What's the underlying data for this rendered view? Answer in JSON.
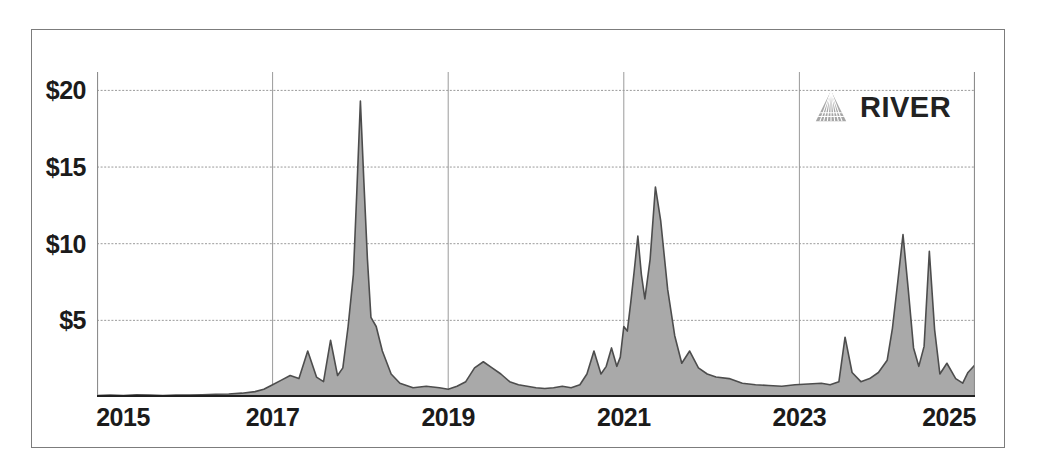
{
  "brand": {
    "name": "RIVER",
    "mark_icon": "river-delta-triangle-icon"
  },
  "chart_data": {
    "type": "area",
    "title": "",
    "subtitle": "",
    "xlabel": "",
    "ylabel": "",
    "grid": true,
    "legend_position": "none",
    "xlim": [
      2015,
      2025
    ],
    "ylim": [
      0,
      21.2
    ],
    "y_ticks": [
      5,
      10,
      15,
      20
    ],
    "y_tick_labels": [
      "$5",
      "$10",
      "$15",
      "$20"
    ],
    "x_ticks": [
      2015,
      2017,
      2019,
      2021,
      2023,
      2025
    ],
    "x_tick_labels": [
      "2015",
      "2017",
      "2019",
      "2021",
      "2023",
      "2025"
    ],
    "series": [
      {
        "name": "value",
        "fill_color": "#a9a9a9",
        "line_color": "#4d4d4d",
        "x": [
          2015.0,
          2015.15,
          2015.3,
          2015.45,
          2015.6,
          2015.75,
          2015.9,
          2016.05,
          2016.2,
          2016.35,
          2016.5,
          2016.65,
          2016.8,
          2016.9,
          2017.0,
          2017.1,
          2017.2,
          2017.3,
          2017.4,
          2017.5,
          2017.58,
          2017.66,
          2017.74,
          2017.8,
          2017.86,
          2017.92,
          2017.96,
          2018.0,
          2018.04,
          2018.08,
          2018.12,
          2018.18,
          2018.25,
          2018.35,
          2018.45,
          2018.6,
          2018.75,
          2018.9,
          2019.0,
          2019.1,
          2019.2,
          2019.3,
          2019.4,
          2019.5,
          2019.6,
          2019.7,
          2019.8,
          2019.9,
          2020.0,
          2020.1,
          2020.2,
          2020.3,
          2020.4,
          2020.5,
          2020.58,
          2020.66,
          2020.74,
          2020.8,
          2020.86,
          2020.92,
          2020.96,
          2021.0,
          2021.04,
          2021.08,
          2021.12,
          2021.16,
          2021.2,
          2021.24,
          2021.3,
          2021.36,
          2021.42,
          2021.5,
          2021.58,
          2021.66,
          2021.75,
          2021.85,
          2021.95,
          2022.05,
          2022.2,
          2022.35,
          2022.5,
          2022.65,
          2022.8,
          2022.95,
          2023.1,
          2023.25,
          2023.35,
          2023.45,
          2023.52,
          2023.6,
          2023.7,
          2023.8,
          2023.9,
          2024.0,
          2024.06,
          2024.12,
          2024.18,
          2024.24,
          2024.3,
          2024.36,
          2024.42,
          2024.48,
          2024.54,
          2024.6,
          2024.68,
          2024.78,
          2024.86,
          2024.92,
          2025.0
        ],
        "y": [
          0.1,
          0.12,
          0.1,
          0.15,
          0.12,
          0.1,
          0.13,
          0.12,
          0.15,
          0.18,
          0.2,
          0.25,
          0.35,
          0.5,
          0.8,
          1.1,
          1.4,
          1.2,
          3.0,
          1.3,
          1.0,
          3.7,
          1.4,
          1.9,
          4.6,
          8.0,
          13.5,
          19.3,
          14.0,
          9.0,
          5.2,
          4.6,
          3.0,
          1.5,
          0.9,
          0.6,
          0.7,
          0.6,
          0.5,
          0.7,
          1.0,
          1.9,
          2.3,
          1.9,
          1.5,
          1.0,
          0.8,
          0.7,
          0.6,
          0.55,
          0.6,
          0.7,
          0.6,
          0.8,
          1.5,
          3.0,
          1.5,
          2.0,
          3.2,
          2.0,
          2.6,
          4.6,
          4.3,
          6.2,
          8.3,
          10.5,
          8.0,
          6.4,
          9.0,
          13.7,
          11.5,
          7.0,
          4.0,
          2.2,
          3.0,
          1.9,
          1.5,
          1.3,
          1.2,
          0.9,
          0.8,
          0.75,
          0.7,
          0.8,
          0.85,
          0.9,
          0.8,
          1.0,
          3.9,
          1.6,
          1.0,
          1.2,
          1.6,
          2.4,
          4.5,
          7.5,
          10.6,
          7.0,
          3.2,
          2.0,
          3.3,
          9.5,
          4.4,
          1.5,
          2.2,
          1.2,
          0.9,
          1.6,
          2.1
        ]
      }
    ]
  }
}
